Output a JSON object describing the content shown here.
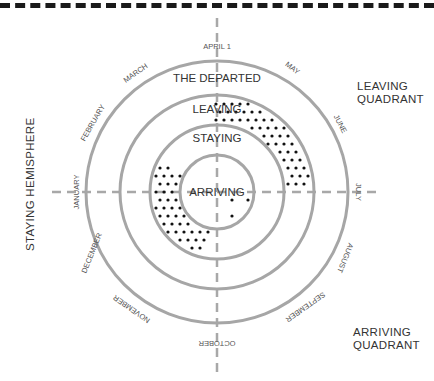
{
  "diagram": {
    "quadrants": {
      "top_right": [
        "LEAVING",
        "QUADRANT"
      ],
      "bottom_right": [
        "ARRIVING",
        "QUADRANT"
      ],
      "left": "STAYING HEMISPHERE"
    },
    "rings": [
      "THE DEPARTED",
      "LEAVING",
      "STAYING",
      "ARRIVING"
    ],
    "months": {
      "top": "APRIL 1",
      "may": "MAY",
      "june": "JUNE",
      "july": "JULY",
      "august": "AUGUST",
      "september": "SEPTEMBER",
      "october": "OCTOBER",
      "november": "NOVEMBER",
      "december": "DECEMBER",
      "january": "JANUARY",
      "february": "FEBRUARY",
      "march": "MARCH"
    },
    "colors": {
      "ring": "#a6a6a6",
      "axis": "#a6a6a6",
      "dot": "#111111",
      "text": "#333333"
    }
  }
}
